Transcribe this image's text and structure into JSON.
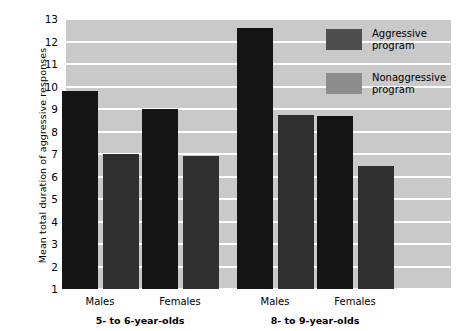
{
  "chart_data": {
    "type": "bar",
    "title": "",
    "xlabel": "",
    "ylabel": "Mean total duration of aggressive responses",
    "ylim": [
      1,
      13
    ],
    "yticks": [
      1,
      2,
      3,
      4,
      5,
      6,
      7,
      8,
      9,
      10,
      11,
      12,
      13
    ],
    "grid": true,
    "legend_position": "top-right",
    "categories": [
      "Males",
      "Females",
      "Males",
      "Females"
    ],
    "groups": [
      {
        "label": "5- to 6-year-olds",
        "categories": [
          "Males",
          "Females"
        ]
      },
      {
        "label": "8- to 9-year-olds",
        "categories": [
          "Males",
          "Females"
        ]
      }
    ],
    "series": [
      {
        "name": "Aggressive program",
        "values": [
          9.8,
          9.0,
          12.6,
          8.7
        ]
      },
      {
        "name": "Nonaggressive program",
        "values": [
          7.0,
          6.9,
          8.75,
          6.45
        ]
      }
    ]
  },
  "legend": {
    "items": [
      {
        "label_line1": "Aggressive",
        "label_line2": "program",
        "color": "#4e4e4e"
      },
      {
        "label_line1": "Nonaggressive",
        "label_line2": "program",
        "color": "#8d8d8d"
      }
    ]
  },
  "colors": {
    "plot_background": "#c9c9c9",
    "gridline": "#ffffff",
    "bar_aggressive": "#141414",
    "bar_nonaggressive": "#2f2f2f",
    "text": "#000000",
    "page_background": "#ffffff"
  }
}
